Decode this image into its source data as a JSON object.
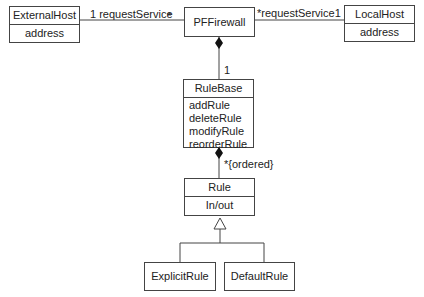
{
  "classes": {
    "external_host": {
      "name": "ExternalHost",
      "attribute": "address"
    },
    "pf_firewall": {
      "name": "PFFirewall"
    },
    "local_host": {
      "name": "LocalHost",
      "attribute": "address"
    },
    "rule_base": {
      "name": "RuleBase",
      "operations": [
        "addRule",
        "deleteRule",
        "modifyRule",
        "reorderRule"
      ]
    },
    "rule": {
      "name": "Rule",
      "attribute": "In/out"
    },
    "explicit_rule": {
      "name": "ExplicitRule"
    },
    "default_rule": {
      "name": "DefaultRule"
    }
  },
  "associations": {
    "external_left": "1 requestService",
    "external_right_mult": "*",
    "local_left": "*requestService1",
    "firewall_rulebase_mult": "1",
    "rulebase_rule": "*{ordered}"
  }
}
